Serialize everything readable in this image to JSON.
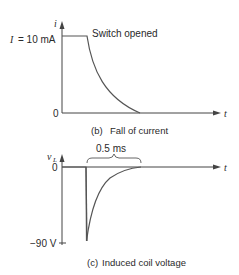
{
  "figure_b": {
    "y_axis_label": "i",
    "x_axis_label": "t",
    "level_label_var": "I",
    "level_label_value": "= 10 mA",
    "zero_label": "0",
    "annotation": "Switch opened",
    "caption_letter": "(b)",
    "caption_text": "Fall of current"
  },
  "figure_c": {
    "y_axis_label_main": "v",
    "y_axis_label_sub": "L",
    "x_axis_label": "t",
    "zero_label": "0",
    "min_label": "−90 V",
    "interval_label": "0.5 ms",
    "caption_letter": "(c)",
    "caption_text": "Induced coil voltage"
  },
  "colors": {
    "line": "#555555",
    "text": "#2a2a2a",
    "background": "#ffffff"
  }
}
